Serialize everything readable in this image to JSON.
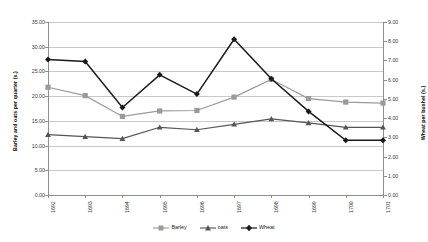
{
  "chart_data": {
    "type": "line",
    "title": "",
    "xlabel": "",
    "ylabel": "Barley and oats per quarter (s.)",
    "y2label": "Wheat per bushel (s.)",
    "categories": [
      "1692",
      "1693",
      "1694",
      "1695",
      "1696",
      "1697",
      "1698",
      "1699",
      "1700",
      "1701"
    ],
    "ylim": [
      0,
      35
    ],
    "y2lim": [
      0,
      9
    ],
    "yticks": [
      "0.00",
      "5.00",
      "10.00",
      "15.00",
      "20.00",
      "25.00",
      "30.00",
      "35.00"
    ],
    "y2ticks": [
      "0.00",
      "1.00",
      "2.00",
      "3.00",
      "4.00",
      "5.00",
      "6.00",
      "7.00",
      "8.00",
      "9.00"
    ],
    "grid": true,
    "legend_position": "bottom",
    "series": [
      {
        "name": "Barley",
        "axis": "left",
        "marker": "square",
        "color": "#9a9a9a",
        "values": [
          21.8,
          20.1,
          15.9,
          17.0,
          17.1,
          19.8,
          23.4,
          19.5,
          18.8,
          18.6
        ]
      },
      {
        "name": "oats",
        "axis": "left",
        "marker": "triangle",
        "color": "#555555",
        "values": [
          12.2,
          11.8,
          11.4,
          13.7,
          13.2,
          14.3,
          15.4,
          14.6,
          13.7,
          13.7
        ]
      },
      {
        "name": "Wheat",
        "axis": "right",
        "marker": "diamond",
        "color": "#1a1a1a",
        "values": [
          7.05,
          6.95,
          4.55,
          6.25,
          5.25,
          8.1,
          6.05,
          4.35,
          2.85,
          2.85
        ]
      }
    ]
  },
  "legend": {
    "items": [
      {
        "label": "Barley"
      },
      {
        "label": "oats"
      },
      {
        "label": "Wheat"
      }
    ]
  },
  "colors": {
    "barley": "#9a9a9a",
    "oats": "#555555",
    "wheat": "#1a1a1a",
    "grid": "#c9c9c9",
    "axis": "#8e8e8e"
  }
}
